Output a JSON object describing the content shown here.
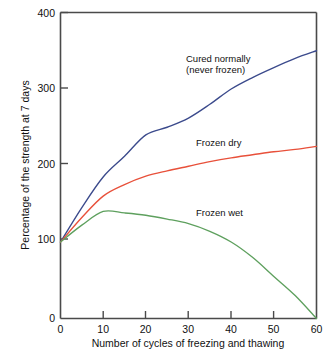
{
  "chart_data": {
    "type": "line",
    "title": "",
    "xlabel": "Number of cycles of freezing and thawing",
    "ylabel": "Percentage of the strength at 7 days",
    "xlim": [
      0,
      60
    ],
    "ylim": [
      0,
      400
    ],
    "xticks": [
      "0",
      "10",
      "20",
      "30",
      "40",
      "50",
      "60"
    ],
    "xtick_values": [
      0,
      10,
      20,
      30,
      40,
      50,
      60
    ],
    "yticks": [
      "0",
      "100",
      "200",
      "300",
      "400"
    ],
    "ytick_values": [
      0,
      100,
      200,
      300,
      400
    ],
    "grid": false,
    "legend_position": "inline-annotations",
    "series": [
      {
        "name": "Cured normally (never frozen)",
        "color": "#3b4a8c",
        "x": [
          0,
          5,
          10,
          15,
          20,
          25,
          30,
          35,
          40,
          45,
          50,
          55,
          60
        ],
        "values": [
          100,
          145,
          185,
          212,
          240,
          250,
          262,
          280,
          300,
          315,
          328,
          340,
          350
        ]
      },
      {
        "name": "Frozen dry",
        "color": "#e8503a",
        "x": [
          0,
          5,
          10,
          15,
          20,
          25,
          30,
          35,
          40,
          45,
          50,
          55,
          60
        ],
        "values": [
          100,
          132,
          160,
          175,
          186,
          193,
          199,
          205,
          210,
          214,
          218,
          221,
          225
        ]
      },
      {
        "name": "Frozen wet",
        "color": "#5ea05e",
        "x": [
          0,
          5,
          10,
          15,
          20,
          25,
          30,
          35,
          40,
          45,
          50,
          55,
          60
        ],
        "values": [
          100,
          122,
          140,
          138,
          135,
          130,
          124,
          114,
          100,
          80,
          55,
          30,
          0
        ]
      }
    ],
    "annotations": [
      {
        "name": "cured-normally",
        "line1": "Cured normally",
        "line2": "(never frozen)",
        "x": 186,
        "y": 62
      },
      {
        "name": "frozen-dry",
        "line1": "Frozen dry",
        "line2": "",
        "x": 196,
        "y": 146
      },
      {
        "name": "frozen-wet",
        "line1": "Frozen wet",
        "line2": "",
        "x": 196,
        "y": 216
      }
    ]
  },
  "axis": {
    "y_title": "Percentage of the strength at 7 days",
    "x_title": "Number of cycles of freezing and thawing",
    "y_labels": {
      "t0": "0",
      "t1": "100",
      "t2": "200",
      "t3": "300",
      "t4": "400"
    },
    "x_labels": {
      "t0": "0",
      "t1": "10",
      "t2": "20",
      "t3": "30",
      "t4": "40",
      "t5": "50",
      "t6": "60"
    }
  },
  "annotations": {
    "cured_line1": "Cured normally",
    "cured_line2": "(never frozen)",
    "frozen_dry": "Frozen dry",
    "frozen_wet": "Frozen wet"
  },
  "colors": {
    "cured_normally": "#3b4a8c",
    "frozen_dry": "#e8503a",
    "frozen_wet": "#5ea05e",
    "axis": "#4a4a4a",
    "background": "#ffffff"
  }
}
